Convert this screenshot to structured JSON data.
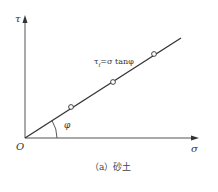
{
  "diagram": {
    "axes": {
      "y_label": "τ",
      "x_label": "σ",
      "origin_label": "O"
    },
    "equation": {
      "tau": "τ",
      "sub": "f",
      "rest": "=σ tanφ"
    },
    "angle_label": "φ",
    "points": [
      {
        "x": 71,
        "y": 107
      },
      {
        "x": 113,
        "y": 82
      },
      {
        "x": 154,
        "y": 54
      }
    ],
    "caption": "（a）砂土",
    "colors": {
      "line": "#333333",
      "axis": "#555555"
    }
  }
}
